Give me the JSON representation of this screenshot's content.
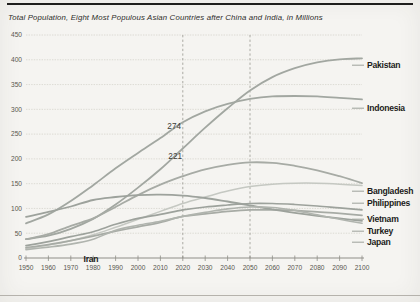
{
  "page": {
    "title": "Total Population, Eight Most Populous Asian Countries after China and India, in Millions"
  },
  "colors": {
    "background": "#f5f4f1",
    "top_rule": "#1e1e1c",
    "bottom_rule": "#b5b2ac",
    "grid": "#d6d4cd",
    "axis": "#8f8e88",
    "reference_dashed": "#a3a29b",
    "line_default": "#a4a8a2",
    "line_light": "#c5c8c2",
    "text": "#2d2d2a"
  },
  "chart_data": {
    "type": "line",
    "title": "Total Population, Eight Most Populous Asian Countries after China and India, in Millions",
    "unit": "millions of people",
    "xlabel": "",
    "ylabel": "",
    "xlim": [
      1950,
      2100
    ],
    "ylim": [
      0,
      450
    ],
    "y_tick_step": 50,
    "y_ticks": [
      0,
      50,
      100,
      150,
      200,
      250,
      300,
      350,
      400,
      450
    ],
    "x_ticks": [
      1950,
      1960,
      1970,
      1980,
      1990,
      2000,
      2010,
      2020,
      2030,
      2040,
      2050,
      2060,
      2070,
      2080,
      2090,
      2100
    ],
    "grid": "horizontal",
    "legend_position": "right-edge-labels",
    "reference_years_dashed": [
      2020,
      2050
    ],
    "x": [
      1950,
      1960,
      1970,
      1980,
      1990,
      2000,
      2010,
      2020,
      2030,
      2040,
      2050,
      2060,
      2070,
      2080,
      2090,
      2100
    ],
    "series": [
      {
        "name": "Pakistan",
        "color": "#a2a7a1",
        "width": 1.8,
        "values": [
          38,
          45,
          59,
          79,
          108,
          142,
          179,
          221,
          263,
          302,
          338,
          365,
          383,
          395,
          401,
          403
        ]
      },
      {
        "name": "Indonesia",
        "color": "#a2a7a1",
        "width": 1.8,
        "values": [
          70,
          88,
          115,
          147,
          181,
          212,
          242,
          274,
          296,
          311,
          321,
          326,
          327,
          326,
          323,
          320
        ]
      },
      {
        "name": "Bangladesh",
        "color": "#a7aba5",
        "width": 1.8,
        "values": [
          38,
          48,
          65,
          80,
          103,
          127,
          148,
          165,
          179,
          188,
          193,
          192,
          186,
          177,
          165,
          151
        ]
      },
      {
        "name": "Philippines",
        "color": "#c5c8c2",
        "width": 1.5,
        "values": [
          19,
          26,
          35,
          47,
          62,
          78,
          94,
          110,
          123,
          135,
          144,
          149,
          151,
          151,
          149,
          146
        ]
      },
      {
        "name": "Vietnam",
        "color": "#9da29c",
        "width": 1.7,
        "values": [
          25,
          33,
          43,
          53,
          68,
          80,
          88,
          97,
          103,
          107,
          110,
          110,
          108,
          105,
          101,
          97
        ]
      },
      {
        "name": "Turkey",
        "color": "#a7aba5",
        "width": 1.7,
        "values": [
          21,
          27,
          35,
          44,
          54,
          63,
          72,
          84,
          89,
          94,
          97,
          97,
          96,
          93,
          90,
          86
        ]
      },
      {
        "name": "Japan",
        "color": "#9da29c",
        "width": 1.8,
        "values": [
          83,
          93,
          104,
          117,
          123,
          127,
          128,
          126,
          121,
          114,
          106,
          98,
          91,
          85,
          80,
          75
        ]
      },
      {
        "name": "Iran",
        "color": "#b0b4ae",
        "width": 1.6,
        "values": [
          17,
          22,
          28,
          38,
          56,
          66,
          74,
          84,
          92,
          99,
          103,
          102,
          96,
          87,
          78,
          70
        ]
      }
    ],
    "annotations": [
      {
        "text": "274",
        "year": 2020,
        "value": 274,
        "series": "Indonesia",
        "tx": 181,
        "ty": 129
      },
      {
        "text": "221",
        "year": 2020,
        "value": 221,
        "series": "Pakistan",
        "tx": 182,
        "ty": 159
      }
    ],
    "layout": {
      "plot": {
        "left": 26,
        "right": 362,
        "top": 35,
        "bottom": 258
      },
      "title_pos": {
        "x": 8,
        "y": 20
      },
      "label_x": 367,
      "leader": {
        "x1": 352,
        "x2": 364
      },
      "right_label_baselines": {
        "Pakistan": 68,
        "Indonesia": 111,
        "Bangladesh": 194,
        "Philippines": 206,
        "Vietnam": 222,
        "Turkey": 234,
        "Japan": 245
      },
      "start_labels": [
        {
          "series": "Iran",
          "x": 91,
          "y": 262
        }
      ],
      "x_tick_label_baseline": 270
    }
  }
}
